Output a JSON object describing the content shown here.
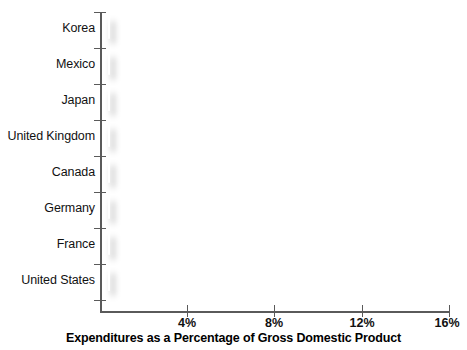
{
  "chart_data": {
    "type": "bar",
    "orientation": "horizontal",
    "title": "",
    "xlabel": "Expenditures as a Percentage of Gross Domestic Product",
    "ylabel": "",
    "categories": [
      "Korea",
      "Mexico",
      "Japan",
      "United Kingdom",
      "Canada",
      "Germany",
      "France",
      "United States"
    ],
    "values": [
      5.5,
      5.9,
      7.4,
      7.8,
      9.3,
      10.6,
      11.0,
      15.4
    ],
    "value_suffix": "%",
    "xlim": [
      0,
      16
    ],
    "xticks": [
      4,
      8,
      12,
      16
    ],
    "xticklabels": [
      "4%",
      "8%",
      "12%",
      "16%"
    ],
    "grid": false,
    "legend": null,
    "series": [
      {
        "name": "Health expenditures",
        "values": [
          5.5,
          5.9,
          7.4,
          7.8,
          9.3,
          10.6,
          11.0,
          15.4
        ]
      }
    ],
    "colors": {
      "bar_fill": "#d0d0d0",
      "bar_border": "#ffffff",
      "axis": "#5a5a5a",
      "text": "#111111",
      "background": "#ffffff"
    }
  },
  "axis": {
    "x_title": "Expenditures as a Percentage of Gross Domestic Product",
    "tick_labels": [
      "4%",
      "8%",
      "12%",
      "16%"
    ]
  },
  "categories": [
    {
      "label": "Korea"
    },
    {
      "label": "Mexico"
    },
    {
      "label": "Japan"
    },
    {
      "label": "United Kingdom"
    },
    {
      "label": "Canada"
    },
    {
      "label": "Germany"
    },
    {
      "label": "France"
    },
    {
      "label": "United States"
    }
  ]
}
